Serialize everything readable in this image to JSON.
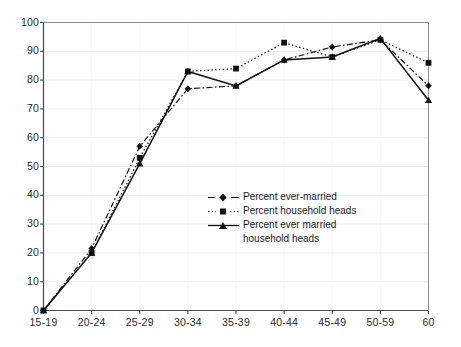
{
  "chart_data": {
    "type": "line",
    "title": "",
    "subtitle": "",
    "xlabel": "",
    "ylabel": "",
    "categories": [
      "15-19",
      "20-24",
      "25-29",
      "30-34",
      "35-39",
      "40-44",
      "45-49",
      "50-59",
      "60"
    ],
    "ylim": [
      0,
      100
    ],
    "yticks": [
      0,
      10,
      20,
      30,
      40,
      50,
      60,
      70,
      80,
      90,
      100
    ],
    "grid": true,
    "legend_position": "center-right-inside",
    "series": [
      {
        "name": "Percent ever-married",
        "marker": "diamond",
        "line_style": "dash-dot",
        "color": "#111111",
        "values": [
          0,
          21.5,
          57,
          77,
          78,
          87,
          91.5,
          94,
          78
        ]
      },
      {
        "name": "Percent household heads",
        "marker": "square",
        "line_style": "dotted",
        "color": "#111111",
        "values": [
          0,
          20,
          53,
          83,
          84,
          93,
          88,
          94,
          86
        ]
      },
      {
        "name": "Percent ever married household heads",
        "marker": "triangle",
        "line_style": "solid",
        "color": "#111111",
        "values": [
          0,
          20,
          51,
          83,
          78,
          87,
          88,
          94.5,
          73
        ]
      }
    ]
  },
  "legend": {
    "items": [
      {
        "label": "Percent ever-married",
        "label2": ""
      },
      {
        "label": "Percent household heads",
        "label2": ""
      },
      {
        "label": "Percent ever married",
        "label2": "household  heads"
      }
    ]
  },
  "axes": {
    "y_tick_labels": [
      "0",
      "10",
      "20",
      "30",
      "40",
      "50",
      "60",
      "70",
      "80",
      "90",
      "100"
    ],
    "x_tick_labels": [
      "15-19",
      "20-24",
      "25-29",
      "30-34",
      "35-39",
      "40-44",
      "45-49",
      "50-59",
      "60"
    ]
  }
}
